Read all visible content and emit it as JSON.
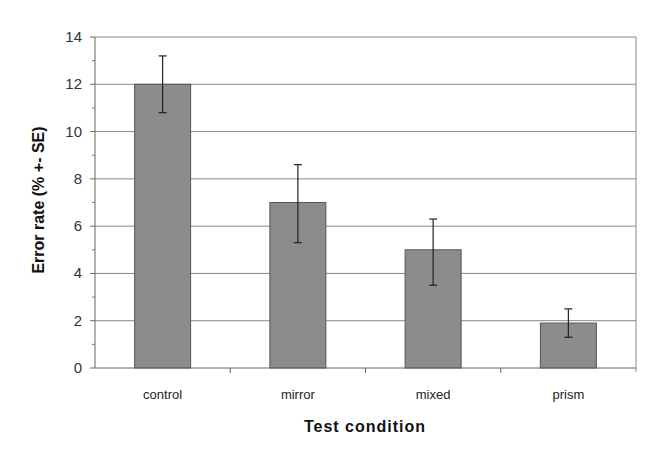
{
  "chart_data": {
    "type": "bar",
    "title": "",
    "xlabel": "Test condition",
    "ylabel": "Error rate (% +- SE)",
    "categories": [
      "control",
      "mirror",
      "mixed",
      "prism"
    ],
    "values": [
      12,
      7,
      5,
      1.9
    ],
    "error_upper": [
      13.2,
      8.6,
      6.3,
      2.5
    ],
    "error_lower": [
      10.8,
      5.3,
      3.5,
      1.3
    ],
    "ylim": [
      0,
      14
    ],
    "yticks": [
      0,
      2,
      4,
      6,
      8,
      10,
      12,
      14
    ],
    "grid": true,
    "legend": "none",
    "bar_color": "#8c8c8c",
    "grid_color": "#888888"
  }
}
